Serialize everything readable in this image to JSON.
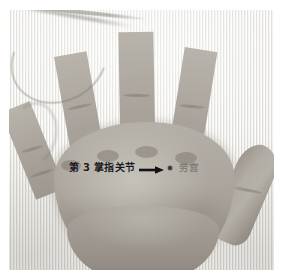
{
  "figure": {
    "type": "anatomical-photograph",
    "orientation": "palmar-view",
    "color_mode": "grayscale"
  },
  "annotations": {
    "joint_label": "第 3 掌指关节",
    "arrow_icon": "right-arrow-icon",
    "point_marker_icon": "acupoint-dot-icon",
    "point_label": "劳宫"
  },
  "colors": {
    "page_background": "#ffffff",
    "photo_background": "#e9e8e4",
    "skin_midtone": "#aaa49c",
    "skin_highlight": "#bab5ac",
    "skin_shadow": "#8a847c",
    "label_text": "#18181a",
    "point_label_text": "#7a7670",
    "marker_dot": "#3a3a3c"
  },
  "layout": {
    "photo_left": 9,
    "photo_top": 10,
    "photo_width": 265,
    "photo_height": 260
  }
}
